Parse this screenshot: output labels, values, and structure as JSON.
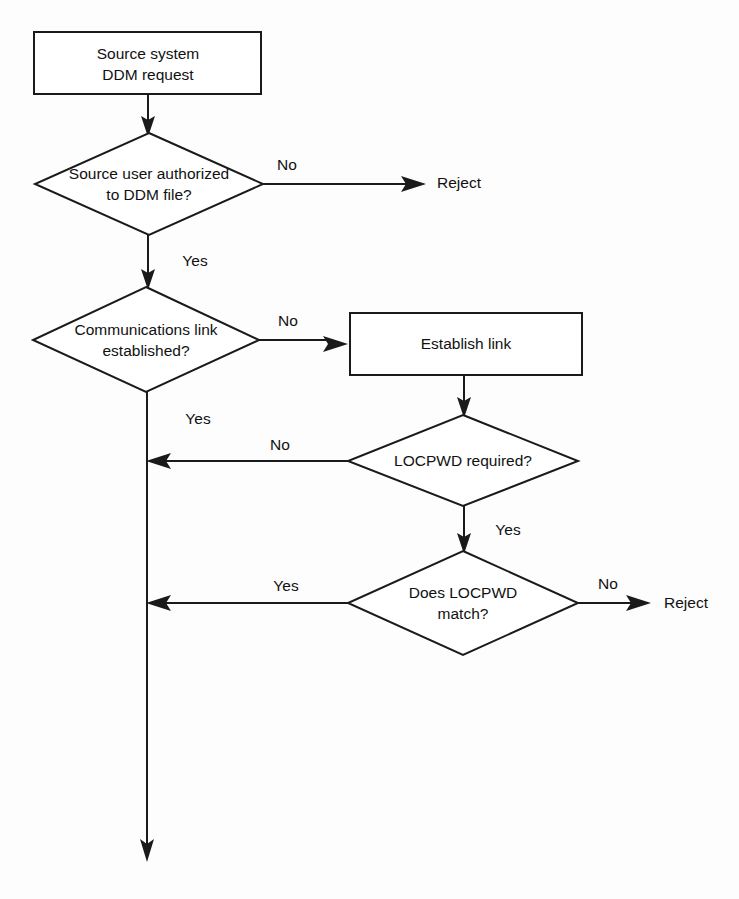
{
  "diagram": {
    "type": "flowchart",
    "colors": {
      "background": "#fdfdfd",
      "shape_fill": "#ffffff",
      "stroke": "#1a1a1a",
      "text": "#111111"
    },
    "nodes": [
      {
        "id": "start",
        "shape": "rectangle",
        "line1": "Source system",
        "line2": "DDM request"
      },
      {
        "id": "auth",
        "shape": "diamond",
        "line1": "Source user authorized",
        "line2": "to DDM file?"
      },
      {
        "id": "comms",
        "shape": "diamond",
        "line1": "Communications link",
        "line2": "established?"
      },
      {
        "id": "establish",
        "shape": "rectangle",
        "line1": "Establish link"
      },
      {
        "id": "locpwd_required",
        "shape": "diamond",
        "line1": "LOCPWD required?"
      },
      {
        "id": "locpwd_match",
        "shape": "diamond",
        "line1": "Does LOCPWD",
        "line2": "match?"
      },
      {
        "id": "reject_auth",
        "shape": "terminal-text",
        "line1": "Reject"
      },
      {
        "id": "reject_locpwd",
        "shape": "terminal-text",
        "line1": "Reject"
      }
    ],
    "edges": [
      {
        "id": "start-to-auth",
        "from": "start",
        "to": "auth",
        "label": ""
      },
      {
        "id": "auth-no",
        "from": "auth",
        "to": "reject_auth",
        "label": "No"
      },
      {
        "id": "auth-yes",
        "from": "auth",
        "to": "comms",
        "label": "Yes"
      },
      {
        "id": "comms-no",
        "from": "comms",
        "to": "establish",
        "label": "No"
      },
      {
        "id": "comms-yes",
        "from": "comms",
        "to": "exit",
        "label": "Yes"
      },
      {
        "id": "establish-to-locpwd",
        "from": "establish",
        "to": "locpwd_required",
        "label": ""
      },
      {
        "id": "locpwd-required-no",
        "from": "locpwd_required",
        "to": "spine",
        "label": "No"
      },
      {
        "id": "locpwd-required-yes",
        "from": "locpwd_required",
        "to": "locpwd_match",
        "label": "Yes"
      },
      {
        "id": "locpwd-match-yes",
        "from": "locpwd_match",
        "to": "spine",
        "label": "Yes"
      },
      {
        "id": "locpwd-match-no",
        "from": "locpwd_match",
        "to": "reject_locpwd",
        "label": "No"
      }
    ]
  }
}
